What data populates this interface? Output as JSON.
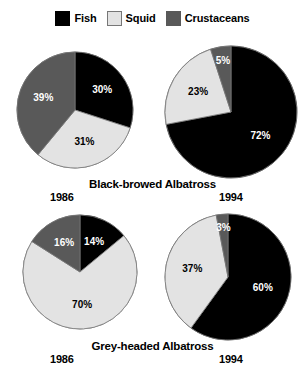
{
  "legend": {
    "items": [
      {
        "label": "Fish",
        "color": "#000000",
        "swatch_name": "legend-swatch-fish",
        "outlined": false
      },
      {
        "label": "Squid",
        "color": "#e3e3e3",
        "swatch_name": "legend-swatch-squid",
        "outlined": true
      },
      {
        "label": "Crustaceans",
        "color": "#595959",
        "swatch_name": "legend-swatch-crustaceans",
        "outlined": false
      }
    ]
  },
  "colors": {
    "fish": "#000000",
    "squid": "#e3e3e3",
    "crustaceans": "#595959",
    "outline": "#777777",
    "background": "#ffffff"
  },
  "panels": {
    "top_left": {
      "year": "1986",
      "species": "Black-browed Albatross"
    },
    "top_right": {
      "year": "1994",
      "species": "Black-browed Albatross"
    },
    "bottom_left": {
      "year": "1986",
      "species": "Grey-headed Albatross"
    },
    "bottom_right": {
      "year": "1994",
      "species": "Grey-headed Albatross"
    }
  },
  "captions": {
    "row1_species": "Black-browed Albatross",
    "row1_year_left": "1986",
    "row1_year_right": "1994",
    "row2_species": "Grey-headed Albatross",
    "row2_year_left": "1986",
    "row2_year_right": "1994"
  },
  "labels": {
    "tl_fish": "30%",
    "tl_squid": "31%",
    "tl_crust": "39%",
    "tr_fish": "72%",
    "tr_squid": "23%",
    "tr_crust": "5%",
    "bl_fish": "14%",
    "bl_squid": "70%",
    "bl_crust": "16%",
    "br_fish": "60%",
    "br_squid": "37%",
    "br_crust": "3%"
  },
  "chart_data": {
    "type": "pie",
    "title": "",
    "legend_position": "top-center",
    "categories": [
      "Fish",
      "Squid",
      "Crustaceans"
    ],
    "category_colors": [
      "#000000",
      "#e3e3e3",
      "#595959"
    ],
    "start_angle_deg": 0,
    "direction": "clockwise",
    "units": "percent",
    "charts": [
      {
        "name": "Black-browed Albatross 1986",
        "species": "Black-browed Albatross",
        "year": "1986",
        "position": "top-left",
        "values": [
          30,
          31,
          39
        ],
        "labels": [
          "30%",
          "31%",
          "39%"
        ]
      },
      {
        "name": "Black-browed Albatross 1994",
        "species": "Black-browed Albatross",
        "year": "1994",
        "position": "top-right",
        "values": [
          72,
          23,
          5
        ],
        "labels": [
          "72%",
          "23%",
          "5%"
        ]
      },
      {
        "name": "Grey-headed Albatross 1986",
        "species": "Grey-headed Albatross",
        "year": "1986",
        "position": "bottom-left",
        "values": [
          14,
          70,
          16
        ],
        "labels": [
          "14%",
          "70%",
          "16%"
        ]
      },
      {
        "name": "Grey-headed Albatross 1994",
        "species": "Grey-headed Albatross",
        "year": "1994",
        "position": "bottom-right",
        "values": [
          60,
          37,
          3
        ],
        "labels": [
          "60%",
          "37%",
          "3%"
        ]
      }
    ]
  },
  "geometry": {
    "pies": [
      {
        "key": "top-left",
        "cx": 75,
        "cy": 110,
        "r": 58,
        "chart_index": 0
      },
      {
        "key": "top-right",
        "cx": 231,
        "cy": 112,
        "r": 66,
        "chart_index": 1
      },
      {
        "key": "bottom-left",
        "cx": 80,
        "cy": 272,
        "r": 57,
        "chart_index": 2
      },
      {
        "key": "bottom-right",
        "cx": 228,
        "cy": 277,
        "r": 63,
        "chart_index": 3
      }
    ],
    "label_radius_factor": 0.58,
    "small_slice_outside_threshold": 8,
    "small_slice_radius_factor": 0.78
  }
}
